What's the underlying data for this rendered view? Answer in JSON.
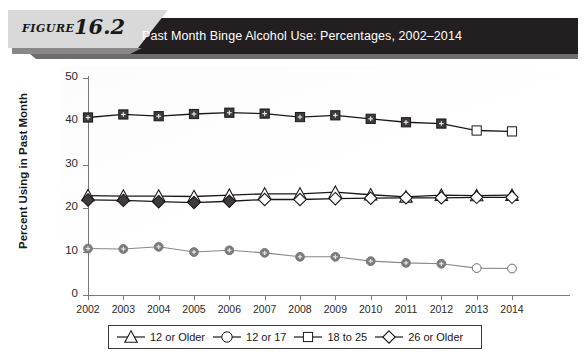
{
  "figure": {
    "label_word": "FIGURE",
    "label_number": "16.2",
    "title": "Past Month Binge Alcohol Use: Percentages, 2002–2014"
  },
  "colors": {
    "banner": "#231f20",
    "tab": "#d9d9d9",
    "dark_marker": "#3f3c3d",
    "gray_marker": "#7d7a7b",
    "line_dark": "#1a1718",
    "line_gray": "#8a8788",
    "axis": "#77797a"
  },
  "chart_data": {
    "type": "line",
    "title": "Past Month Binge Alcohol Use: Percentages, 2002–2014",
    "xlabel": "",
    "ylabel": "Percent Using in Past Month",
    "categories": [
      "2002",
      "2003",
      "2004",
      "2005",
      "2006",
      "2007",
      "2008",
      "2009",
      "2010",
      "2011",
      "2012",
      "2013",
      "2014"
    ],
    "ylim": [
      0,
      50
    ],
    "yticks": [
      0,
      10,
      20,
      30,
      40,
      50
    ],
    "grid": false,
    "legend_position": "bottom",
    "series": [
      {
        "name": "12 or Older",
        "marker": "triangle",
        "filled": false,
        "values": [
          22.9,
          22.8,
          22.8,
          22.7,
          23.0,
          23.3,
          23.3,
          23.7,
          23.1,
          22.6,
          23.0,
          22.9,
          23.0
        ]
      },
      {
        "name": "12 or 17",
        "marker": "circle",
        "filled": true,
        "unfilled_from_index": 11,
        "values": [
          10.7,
          10.6,
          11.1,
          9.9,
          10.3,
          9.7,
          8.8,
          8.8,
          7.8,
          7.4,
          7.2,
          6.2,
          6.1
        ]
      },
      {
        "name": "18 to 25",
        "marker": "square",
        "filled": true,
        "unfilled_from_index": 11,
        "values": [
          40.9,
          41.6,
          41.2,
          41.7,
          42.0,
          41.8,
          41.0,
          41.4,
          40.6,
          39.8,
          39.5,
          37.9,
          37.7
        ]
      },
      {
        "name": "26 or Older",
        "marker": "diamond",
        "filled": true,
        "unfilled_from_index": 5,
        "values": [
          21.9,
          21.8,
          21.5,
          21.3,
          21.6,
          22.0,
          22.0,
          22.2,
          22.3,
          22.4,
          22.4,
          22.5,
          22.5
        ]
      }
    ]
  },
  "legend": {
    "items": [
      {
        "label": "12 or Older",
        "marker": "triangle"
      },
      {
        "label": "12 or 17",
        "marker": "circle"
      },
      {
        "label": "18 to 25",
        "marker": "square"
      },
      {
        "label": "26 or Older",
        "marker": "diamond"
      }
    ]
  }
}
